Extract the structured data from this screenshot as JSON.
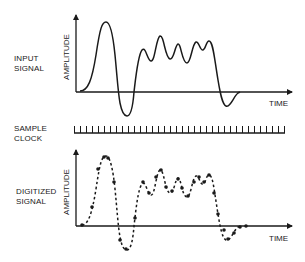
{
  "diagram": {
    "rows": [
      {
        "id": "input",
        "label_line1": "INPUT",
        "label_line2": "SIGNAL",
        "y_axis_label": "AMPLITUDE",
        "x_axis_label": "TIME"
      },
      {
        "id": "clock",
        "label_line1": "SAMPLE",
        "label_line2": "CLOCK",
        "tick_count": 36
      },
      {
        "id": "digitized",
        "label_line1": "DIGITIZED",
        "label_line2": "SIGNAL",
        "y_axis_label": "AMPLITUDE",
        "x_axis_label": "TIME"
      }
    ],
    "colors": {
      "line": "#1a1a1a",
      "background": "#ffffff"
    }
  }
}
